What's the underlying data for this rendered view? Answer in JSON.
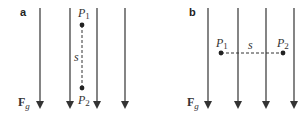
{
  "panels": [
    {
      "id": "a",
      "label": "a",
      "force_label": "F",
      "force_sub": "g",
      "point1": {
        "name": "P",
        "sub": "1"
      },
      "point2": {
        "name": "P",
        "sub": "2"
      },
      "distance_label": "s",
      "orientation": "vertical"
    },
    {
      "id": "b",
      "label": "b",
      "force_label": "F",
      "force_sub": "g",
      "point1": {
        "name": "P",
        "sub": "1"
      },
      "point2": {
        "name": "P",
        "sub": "2"
      },
      "distance_label": "s",
      "orientation": "horizontal"
    }
  ],
  "colors": {
    "line": "#333333",
    "dash": "#333333"
  }
}
